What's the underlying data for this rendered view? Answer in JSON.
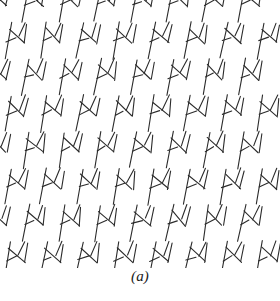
{
  "figure": {
    "caption": "(a)",
    "panel_label": "a",
    "background_color": "#ffffff",
    "stroke_color": "#2b2b2b",
    "stroke_width": 1.1,
    "panel": {
      "x": 0,
      "y": 0,
      "width": 280,
      "height": 268
    }
  },
  "texture": {
    "type": "line-texture",
    "pattern_name": "herringbone-zigzag",
    "tile_width": 36,
    "tile_height": 36.5,
    "row_offset": 18,
    "columns": 8,
    "rows": 8,
    "origin_x": -10,
    "origin_y": -14,
    "motif": {
      "name": "N-chevron",
      "strokes": [
        {
          "name": "long-diagonal-spine",
          "x1": 3.0,
          "y1": 0.0,
          "x2": -3.5,
          "y2": 36.0
        },
        {
          "name": "upper-right-barb",
          "x1": 17.0,
          "y1": 0.0,
          "x2": 11.0,
          "y2": 14.0
        },
        {
          "name": "chevron-left-arm",
          "x1": 1.0,
          "y1": 6.0,
          "x2": 16.5,
          "y2": 20.5
        },
        {
          "name": "chevron-right-arm",
          "x1": 16.5,
          "y1": 20.5,
          "x2": 19.5,
          "y2": 2.5
        },
        {
          "name": "short-left-whisker",
          "x1": -1.5,
          "y1": 19.0,
          "x2": 8.0,
          "y2": 15.0
        }
      ]
    }
  },
  "chart_data": {
    "type": "scatter",
    "title": "(a)",
    "xlabel": "",
    "ylabel": "",
    "note": "Synthetic line-segment texture; not a quantitative plot"
  }
}
